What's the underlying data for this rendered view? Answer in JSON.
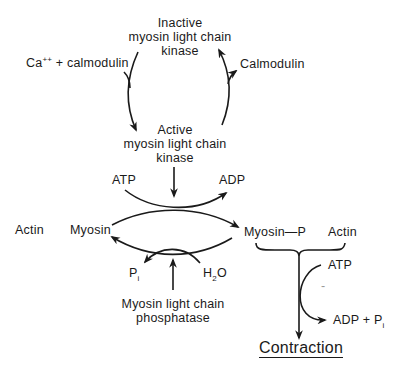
{
  "diagram": {
    "nodes": {
      "inactive_kinase": {
        "line1": "Inactive",
        "line2": "myosin light chain",
        "line3": "kinase"
      },
      "active_kinase": {
        "line1": "Active",
        "line2": "myosin light chain",
        "line3": "kinase"
      },
      "phosphatase": {
        "line1": "Myosin light chain",
        "line2": "phosphatase"
      },
      "myosin": "Myosin",
      "myosin_p": "Myosin—P",
      "actin_left": "Actin",
      "actin_right": "Actin",
      "contraction": "Contraction"
    },
    "cofactors": {
      "ca_calmodulin": {
        "base": "Ca",
        "sup": "++",
        "rest": " + calmodulin"
      },
      "calmodulin_out": "Calmodulin",
      "atp_top": "ATP",
      "adp_top": "ADP",
      "pi_bottom": {
        "base": "P",
        "sub": "i"
      },
      "h2o": {
        "base": "H",
        "sub": "2",
        "rest": "O"
      },
      "atp_right": "ATP",
      "adp_pi_right": {
        "base": "ADP + P",
        "sub": "i"
      },
      "dash_mark": "-"
    },
    "colors": {
      "ink": "#1a1a1a",
      "background": "#ffffff"
    }
  }
}
